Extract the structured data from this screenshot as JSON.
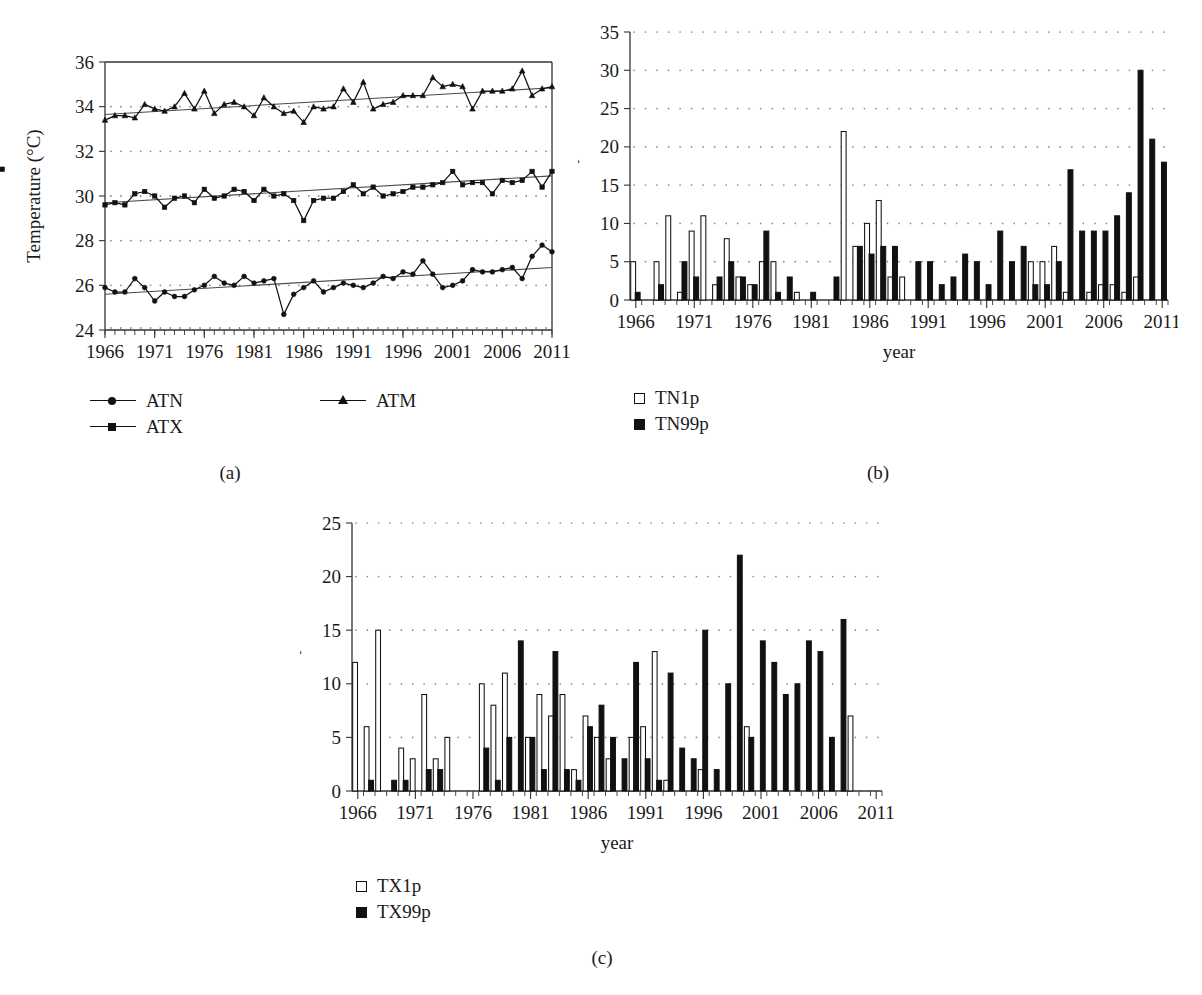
{
  "figure": {
    "panels": [
      {
        "id": "a",
        "label": "(a)"
      },
      {
        "id": "b",
        "label": "(b)"
      },
      {
        "id": "c",
        "label": "(c)"
      }
    ]
  },
  "chart_data": [
    {
      "type": "line",
      "panel": "(a)",
      "title": "",
      "xlabel": "",
      "ylabel": "Temperature (°C)",
      "ylim": [
        24,
        36
      ],
      "yticks": [
        24,
        26,
        28,
        30,
        32,
        34,
        36
      ],
      "xlim": [
        1966,
        2011
      ],
      "xticks": [
        1966,
        1971,
        1976,
        1981,
        1986,
        1991,
        1996,
        2001,
        2006,
        2011
      ],
      "grid": true,
      "legend_position": "below",
      "x": [
        1966,
        1967,
        1968,
        1969,
        1970,
        1971,
        1972,
        1973,
        1974,
        1975,
        1976,
        1977,
        1978,
        1979,
        1980,
        1981,
        1982,
        1983,
        1984,
        1985,
        1986,
        1987,
        1988,
        1989,
        1990,
        1991,
        1992,
        1993,
        1994,
        1995,
        1996,
        1997,
        1998,
        1999,
        2000,
        2001,
        2002,
        2003,
        2004,
        2005,
        2006,
        2007,
        2008,
        2009,
        2010,
        2011
      ],
      "series": [
        {
          "name": "ATM",
          "marker": "triangle",
          "values": [
            33.4,
            33.6,
            33.6,
            33.5,
            34.1,
            33.9,
            33.8,
            34.0,
            34.6,
            33.9,
            34.7,
            33.7,
            34.1,
            34.2,
            34.0,
            33.6,
            34.4,
            34.0,
            33.7,
            33.8,
            33.3,
            34.0,
            33.9,
            34.0,
            34.8,
            34.2,
            35.1,
            33.9,
            34.1,
            34.2,
            34.5,
            34.5,
            34.5,
            35.3,
            34.9,
            35.0,
            34.9,
            33.9,
            34.7,
            34.7,
            34.7,
            34.8,
            35.6,
            34.5,
            34.8,
            34.9
          ],
          "trend": [
            33.65,
            34.85
          ]
        },
        {
          "name": "ATX",
          "marker": "square",
          "values": [
            29.6,
            29.7,
            29.6,
            30.1,
            30.2,
            30.0,
            29.5,
            29.9,
            30.0,
            29.7,
            30.3,
            29.9,
            30.0,
            30.3,
            30.2,
            29.8,
            30.3,
            30.0,
            30.1,
            29.8,
            28.9,
            29.8,
            29.9,
            29.9,
            30.2,
            30.5,
            30.1,
            30.4,
            30.0,
            30.1,
            30.2,
            30.4,
            30.4,
            30.5,
            30.6,
            31.1,
            30.5,
            30.6,
            30.6,
            30.1,
            30.7,
            30.6,
            30.7,
            31.1,
            30.4,
            31.1,
            31.2
          ],
          "trend": [
            29.7,
            30.9
          ]
        },
        {
          "name": "ATN",
          "marker": "circle",
          "values": [
            25.9,
            25.7,
            25.7,
            26.3,
            25.9,
            25.3,
            25.7,
            25.5,
            25.5,
            25.8,
            26.0,
            26.4,
            26.1,
            26.0,
            26.4,
            26.1,
            26.2,
            26.3,
            24.7,
            25.6,
            25.9,
            26.2,
            25.7,
            25.9,
            26.1,
            26.0,
            25.9,
            26.1,
            26.4,
            26.3,
            26.6,
            26.5,
            27.1,
            26.5,
            25.9,
            26.0,
            26.2,
            26.7,
            26.6,
            26.6,
            26.7,
            26.8,
            26.3,
            27.3,
            27.8,
            27.5
          ],
          "trend": [
            25.6,
            26.8
          ]
        }
      ],
      "legend": [
        {
          "name": "ATN",
          "marker": "circle"
        },
        {
          "name": "ATM",
          "marker": "triangle"
        },
        {
          "name": "ATX",
          "marker": "square"
        }
      ]
    },
    {
      "type": "bar",
      "panel": "(b)",
      "title": "",
      "xlabel": "year",
      "ylabel": "Days",
      "ylim": [
        0,
        35
      ],
      "yticks": [
        0,
        5,
        10,
        15,
        20,
        25,
        30,
        35
      ],
      "xticks": [
        1966,
        1971,
        1976,
        1981,
        1986,
        1991,
        1996,
        2001,
        2006,
        2011
      ],
      "grid": true,
      "legend_position": "below-left",
      "categories": [
        1966,
        1967,
        1968,
        1969,
        1970,
        1971,
        1972,
        1973,
        1974,
        1975,
        1976,
        1977,
        1978,
        1979,
        1980,
        1981,
        1982,
        1983,
        1984,
        1985,
        1986,
        1987,
        1988,
        1989,
        1990,
        1991,
        1992,
        1993,
        1994,
        1995,
        1996,
        1997,
        1998,
        1999,
        2000,
        2001,
        2002,
        2003,
        2004,
        2005,
        2006,
        2007,
        2008,
        2009,
        2010,
        2011
      ],
      "series": [
        {
          "name": "TN1p",
          "style": "open",
          "values": [
            5,
            0,
            5,
            11,
            1,
            9,
            11,
            2,
            8,
            3,
            2,
            5,
            5,
            0,
            1,
            0,
            0,
            0,
            22,
            7,
            10,
            13,
            3,
            3,
            0,
            0,
            0,
            0,
            0,
            0,
            0,
            0,
            0,
            0,
            5,
            5,
            7,
            1,
            0,
            1,
            2,
            2,
            1,
            3,
            0,
            0
          ]
        },
        {
          "name": "TN99p",
          "style": "solid",
          "values": [
            1,
            0,
            2,
            0,
            5,
            3,
            0,
            3,
            5,
            3,
            2,
            9,
            1,
            3,
            0,
            1,
            0,
            3,
            0,
            7,
            6,
            7,
            7,
            0,
            5,
            5,
            2,
            3,
            6,
            5,
            2,
            9,
            5,
            7,
            2,
            2,
            5,
            17,
            9,
            9,
            9,
            11,
            14,
            30,
            21,
            18
          ]
        }
      ],
      "legend": [
        {
          "name": "TN1p",
          "style": "open"
        },
        {
          "name": "TN99p",
          "style": "solid"
        }
      ]
    },
    {
      "type": "bar",
      "panel": "(c)",
      "title": "",
      "xlabel": "year",
      "ylabel": "Days",
      "ylim": [
        0,
        25
      ],
      "yticks": [
        0,
        5,
        10,
        15,
        20,
        25
      ],
      "xticks": [
        1966,
        1971,
        1976,
        1981,
        1986,
        1991,
        1996,
        2001,
        2006,
        2011
      ],
      "grid": true,
      "legend_position": "below-left",
      "categories": [
        1966,
        1967,
        1968,
        1969,
        1970,
        1971,
        1972,
        1973,
        1974,
        1975,
        1976,
        1977,
        1978,
        1979,
        1980,
        1981,
        1982,
        1983,
        1984,
        1985,
        1986,
        1987,
        1988,
        1989,
        1990,
        1991,
        1992,
        1993,
        1994,
        1995,
        1996,
        1997,
        1998,
        1999,
        2000,
        2001,
        2002,
        2003,
        2004,
        2005,
        2006,
        2007,
        2008,
        2009,
        2010,
        2011
      ],
      "series": [
        {
          "name": "TX1p",
          "style": "open",
          "values": [
            12,
            6,
            15,
            0,
            4,
            3,
            9,
            3,
            5,
            0,
            0,
            10,
            8,
            11,
            0,
            5,
            9,
            7,
            9,
            2,
            7,
            5,
            3,
            0,
            5,
            6,
            13,
            1,
            0,
            0,
            2,
            0,
            0,
            0,
            6,
            0,
            0,
            0,
            0,
            0,
            0,
            0,
            0,
            7,
            0,
            0
          ]
        },
        {
          "name": "TX99p",
          "style": "solid",
          "values": [
            0,
            1,
            0,
            1,
            1,
            0,
            2,
            2,
            0,
            0,
            0,
            4,
            1,
            5,
            14,
            5,
            2,
            13,
            2,
            1,
            6,
            8,
            5,
            3,
            12,
            3,
            1,
            11,
            4,
            3,
            15,
            2,
            10,
            22,
            5,
            14,
            12,
            9,
            10,
            14,
            13,
            5,
            16,
            0,
            0,
            0
          ]
        }
      ],
      "legend": [
        {
          "name": "TX1p",
          "style": "open"
        },
        {
          "name": "TX99p",
          "style": "solid"
        }
      ]
    }
  ]
}
